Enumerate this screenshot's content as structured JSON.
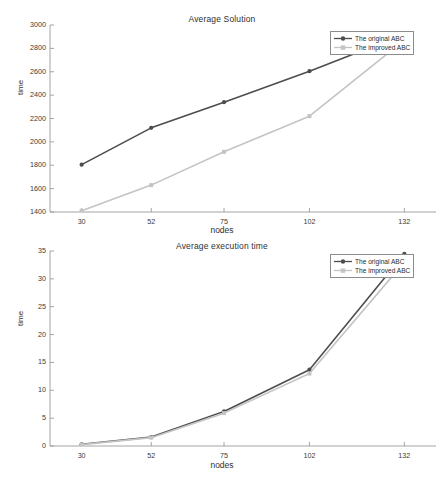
{
  "figure": {
    "background": "#ffffff",
    "width": 444,
    "height": 477
  },
  "series_colors": {
    "original": "#4d4d4d",
    "improved": "#c4c4c4",
    "axis": "#9a9a9a",
    "text": "#333333"
  },
  "charts": [
    {
      "id": "average-solution",
      "title": "Average Solution",
      "xlabel": "nodes",
      "ylabel": "time",
      "legend": {
        "position": "top-right",
        "entries": [
          {
            "label": "The original ABC",
            "color": "#4d4d4d",
            "marker": "circle"
          },
          {
            "label": "The improved ABC",
            "color": "#c4c4c4",
            "marker": "square"
          }
        ]
      },
      "yticks": [
        1400,
        1600,
        1800,
        2000,
        2200,
        2400,
        2600,
        2800,
        3000
      ],
      "xticks": [
        "30",
        "52",
        "75",
        "102",
        "132"
      ]
    },
    {
      "id": "average-execution-time",
      "title": "Average execution time",
      "xlabel": "nodes",
      "ylabel": "time",
      "legend": {
        "position": "top-right",
        "entries": [
          {
            "label": "The original ABC",
            "color": "#4d4d4d",
            "marker": "circle"
          },
          {
            "label": "The improved ABC",
            "color": "#c4c4c4",
            "marker": "square"
          }
        ]
      },
      "yticks": [
        0,
        5,
        10,
        15,
        20,
        25,
        30,
        35
      ],
      "xticks": [
        "30",
        "52",
        "75",
        "102",
        "132"
      ]
    }
  ],
  "chart_data": [
    {
      "type": "line",
      "title": "Average Solution",
      "xlabel": "nodes",
      "ylabel": "time",
      "categories": [
        "30",
        "52",
        "75",
        "102",
        "132"
      ],
      "x": [
        30,
        52,
        75,
        102,
        132
      ],
      "xlim": [
        20,
        142
      ],
      "ylim": [
        1400,
        3000
      ],
      "ytick_step": 200,
      "grid": false,
      "legend_position": "top-right",
      "series": [
        {
          "name": "The original ABC",
          "color": "#4d4d4d",
          "marker": "circle",
          "values": [
            1805,
            2120,
            2340,
            2605,
            2920
          ]
        },
        {
          "name": "The improved ABC",
          "color": "#c4c4c4",
          "marker": "square",
          "values": [
            1410,
            1630,
            1915,
            2220,
            2870
          ]
        }
      ]
    },
    {
      "type": "line",
      "title": "Average execution time",
      "xlabel": "nodes",
      "ylabel": "time",
      "categories": [
        "30",
        "52",
        "75",
        "102",
        "132"
      ],
      "x": [
        30,
        52,
        75,
        102,
        132
      ],
      "xlim": [
        20,
        142
      ],
      "ylim": [
        0,
        35
      ],
      "ytick_step": 5,
      "grid": false,
      "legend_position": "top-right",
      "series": [
        {
          "name": "The original ABC",
          "color": "#4d4d4d",
          "marker": "circle",
          "values": [
            0.3,
            1.6,
            6.2,
            13.7,
            34.5
          ]
        },
        {
          "name": "The improved ABC",
          "color": "#c4c4c4",
          "marker": "square",
          "values": [
            0.25,
            1.5,
            5.9,
            13.0,
            33.0
          ]
        }
      ]
    }
  ]
}
